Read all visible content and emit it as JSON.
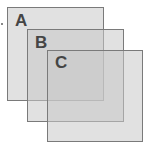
{
  "diagram": {
    "type": "overlapping-squares",
    "colors": {
      "fill": "#d4d4d4",
      "border": "#7a7a7a",
      "label": "#454545"
    },
    "squares": [
      {
        "label": "A",
        "x": 7,
        "y": 7,
        "width": 96,
        "height": 93
      },
      {
        "label": "B",
        "x": 27,
        "y": 29,
        "width": 96,
        "height": 92
      },
      {
        "label": "C",
        "x": 47,
        "y": 50,
        "width": 95,
        "height": 91
      }
    ]
  }
}
